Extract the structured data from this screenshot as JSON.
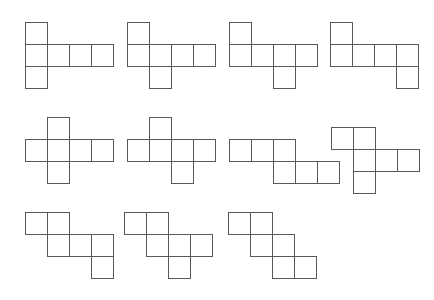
{
  "figure": {
    "background_color": "#ffffff",
    "stroke_color": "#595959",
    "cell_fill": "#ffffff",
    "stroke_width": 1,
    "cell_size": 22,
    "canvas": {
      "width": 434,
      "height": 300
    },
    "net_count": 11
  },
  "nets": [
    {
      "id": "net-1",
      "label": "Net 1",
      "row": 1,
      "column": 1,
      "origin": {
        "x": 25,
        "y": 22
      },
      "cells": [
        {
          "col": 0,
          "row": 0
        },
        {
          "col": 0,
          "row": 1
        },
        {
          "col": 1,
          "row": 1
        },
        {
          "col": 2,
          "row": 1
        },
        {
          "col": 3,
          "row": 1
        },
        {
          "col": 0,
          "row": 2
        }
      ]
    },
    {
      "id": "net-2",
      "label": "Net 2",
      "row": 1,
      "column": 2,
      "origin": {
        "x": 127,
        "y": 22
      },
      "cells": [
        {
          "col": 0,
          "row": 0
        },
        {
          "col": 0,
          "row": 1
        },
        {
          "col": 1,
          "row": 1
        },
        {
          "col": 2,
          "row": 1
        },
        {
          "col": 3,
          "row": 1
        },
        {
          "col": 1,
          "row": 2
        }
      ]
    },
    {
      "id": "net-3",
      "label": "Net 3",
      "row": 1,
      "column": 3,
      "origin": {
        "x": 229,
        "y": 22
      },
      "cells": [
        {
          "col": 0,
          "row": 0
        },
        {
          "col": 0,
          "row": 1
        },
        {
          "col": 1,
          "row": 1
        },
        {
          "col": 2,
          "row": 1
        },
        {
          "col": 3,
          "row": 1
        },
        {
          "col": 2,
          "row": 2
        }
      ]
    },
    {
      "id": "net-4",
      "label": "Net 4",
      "row": 1,
      "column": 4,
      "origin": {
        "x": 330,
        "y": 22
      },
      "cells": [
        {
          "col": 0,
          "row": 0
        },
        {
          "col": 0,
          "row": 1
        },
        {
          "col": 1,
          "row": 1
        },
        {
          "col": 2,
          "row": 1
        },
        {
          "col": 3,
          "row": 1
        },
        {
          "col": 3,
          "row": 2
        }
      ]
    },
    {
      "id": "net-5",
      "label": "Net 5",
      "row": 2,
      "column": 1,
      "origin": {
        "x": 25,
        "y": 117
      },
      "cells": [
        {
          "col": 1,
          "row": 0
        },
        {
          "col": 0,
          "row": 1
        },
        {
          "col": 1,
          "row": 1
        },
        {
          "col": 2,
          "row": 1
        },
        {
          "col": 3,
          "row": 1
        },
        {
          "col": 1,
          "row": 2
        }
      ]
    },
    {
      "id": "net-6",
      "label": "Net 6",
      "row": 2,
      "column": 2,
      "origin": {
        "x": 127,
        "y": 117
      },
      "cells": [
        {
          "col": 1,
          "row": 0
        },
        {
          "col": 0,
          "row": 1
        },
        {
          "col": 1,
          "row": 1
        },
        {
          "col": 2,
          "row": 1
        },
        {
          "col": 3,
          "row": 1
        },
        {
          "col": 2,
          "row": 2
        }
      ]
    },
    {
      "id": "net-7",
      "label": "Net 7",
      "row": 2,
      "column": 3,
      "origin": {
        "x": 229,
        "y": 139
      },
      "cells": [
        {
          "col": 0,
          "row": 0
        },
        {
          "col": 1,
          "row": 0
        },
        {
          "col": 2,
          "row": 0
        },
        {
          "col": 2,
          "row": 1
        },
        {
          "col": 3,
          "row": 1
        },
        {
          "col": 4,
          "row": 1
        }
      ]
    },
    {
      "id": "net-8",
      "label": "Net 8",
      "row": 2,
      "column": 4,
      "origin": {
        "x": 331,
        "y": 127
      },
      "cells": [
        {
          "col": 0,
          "row": 0
        },
        {
          "col": 1,
          "row": 0
        },
        {
          "col": 1,
          "row": 1
        },
        {
          "col": 2,
          "row": 1
        },
        {
          "col": 3,
          "row": 1
        },
        {
          "col": 1,
          "row": 2
        }
      ]
    },
    {
      "id": "net-9",
      "label": "Net 9",
      "row": 3,
      "column": 1,
      "origin": {
        "x": 25,
        "y": 212
      },
      "cells": [
        {
          "col": 0,
          "row": 0
        },
        {
          "col": 1,
          "row": 0
        },
        {
          "col": 1,
          "row": 1
        },
        {
          "col": 2,
          "row": 1
        },
        {
          "col": 3,
          "row": 1
        },
        {
          "col": 3,
          "row": 2
        }
      ]
    },
    {
      "id": "net-10",
      "label": "Net 10",
      "row": 3,
      "column": 2,
      "origin": {
        "x": 124,
        "y": 212
      },
      "cells": [
        {
          "col": 0,
          "row": 0
        },
        {
          "col": 1,
          "row": 0
        },
        {
          "col": 1,
          "row": 1
        },
        {
          "col": 2,
          "row": 1
        },
        {
          "col": 3,
          "row": 1
        },
        {
          "col": 2,
          "row": 2
        }
      ]
    },
    {
      "id": "net-11",
      "label": "Net 11",
      "row": 3,
      "column": 3,
      "origin": {
        "x": 228,
        "y": 212
      },
      "cells": [
        {
          "col": 0,
          "row": 0
        },
        {
          "col": 1,
          "row": 0
        },
        {
          "col": 1,
          "row": 1
        },
        {
          "col": 2,
          "row": 1
        },
        {
          "col": 2,
          "row": 2
        },
        {
          "col": 3,
          "row": 2
        }
      ]
    }
  ]
}
